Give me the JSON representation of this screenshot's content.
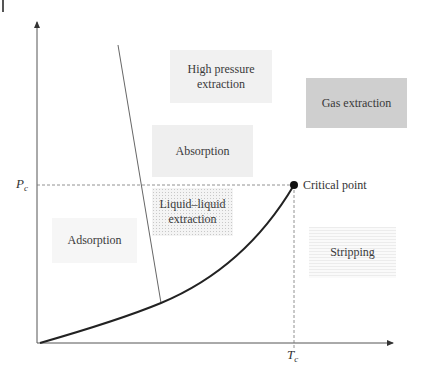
{
  "diagram": {
    "axes": {
      "y_axis_label": "P",
      "y_axis_subscript": "c",
      "x_axis_label": "T",
      "x_axis_subscript": "c"
    },
    "critical_point": {
      "label": "Critical point"
    },
    "regions": [
      {
        "id": "high-pressure",
        "line1": "High pressure",
        "line2": "extraction",
        "shade": "light"
      },
      {
        "id": "gas-extraction",
        "line1": "Gas extraction",
        "shade": "dark"
      },
      {
        "id": "absorption",
        "line1": "Absorption",
        "shade": "medium"
      },
      {
        "id": "liquid-liquid",
        "line1": "Liquid–liquid",
        "line2": "extraction",
        "shade": "dotted"
      },
      {
        "id": "adsorption",
        "line1": "Adsorption",
        "shade": "lighter"
      },
      {
        "id": "stripping",
        "line1": "Stripping",
        "shade": "lines"
      }
    ]
  }
}
